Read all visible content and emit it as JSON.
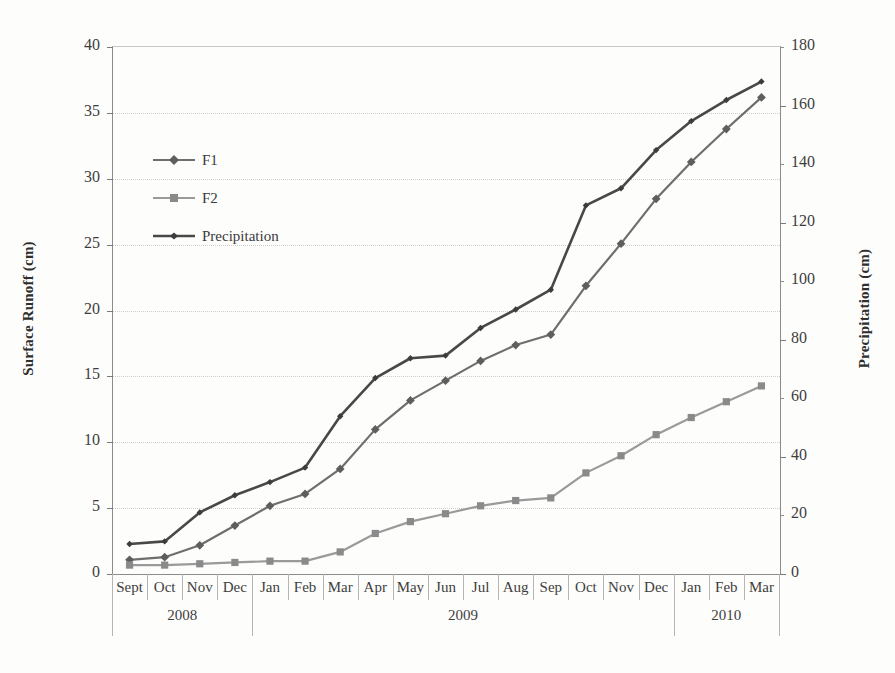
{
  "chart_data": {
    "type": "line",
    "title": "",
    "xlabel": "",
    "ylabel": "Surface Runoff (cm)",
    "y2label": "Precipitation (cm)",
    "ylim": [
      0,
      40
    ],
    "y2lim": [
      0,
      180
    ],
    "yticks": [
      0,
      5,
      10,
      15,
      20,
      25,
      30,
      35,
      40
    ],
    "y2ticks": [
      0,
      20,
      40,
      60,
      80,
      100,
      120,
      140,
      160,
      180
    ],
    "grid": true,
    "legend_position": "upper-left-inside",
    "categories": [
      "Sept",
      "Oct",
      "Nov",
      "Dec",
      "Jan",
      "Feb",
      "Mar",
      "Apr",
      "May",
      "Jun",
      "Jul",
      "Aug",
      "Sep",
      "Oct",
      "Nov",
      "Dec",
      "Jan",
      "Feb",
      "Mar"
    ],
    "year_groups": [
      {
        "label": "2008",
        "start": 0,
        "count": 4
      },
      {
        "label": "2009",
        "start": 4,
        "count": 12
      },
      {
        "label": "2010",
        "start": 16,
        "count": 3
      }
    ],
    "series": [
      {
        "name": "F1",
        "axis": "left",
        "color": "#6e6e6e",
        "marker": "diamond",
        "values": [
          1.0,
          1.2,
          2.1,
          3.6,
          5.1,
          6.0,
          7.9,
          10.9,
          13.1,
          14.6,
          16.1,
          17.3,
          18.1,
          21.8,
          25.0,
          28.4,
          31.2,
          33.7,
          36.1
        ]
      },
      {
        "name": "F2",
        "axis": "left",
        "color": "#9a9a9a",
        "marker": "square",
        "values": [
          0.6,
          0.6,
          0.7,
          0.8,
          0.9,
          0.9,
          1.6,
          3.0,
          3.9,
          4.5,
          5.1,
          5.5,
          5.7,
          7.6,
          8.9,
          10.5,
          11.8,
          13.0,
          14.2
        ]
      },
      {
        "name": "Precipitation",
        "axis": "right",
        "color": "#484848",
        "marker": "small-diamond",
        "values_left_scale": [
          2.2,
          2.4,
          4.6,
          5.9,
          6.9,
          8.0,
          11.9,
          14.8,
          16.3,
          16.5,
          18.6,
          20.0,
          21.5,
          27.9,
          29.2,
          32.1,
          34.3,
          35.9,
          37.3
        ],
        "values": [
          9.9,
          10.8,
          20.7,
          26.6,
          31.1,
          36.0,
          53.6,
          66.6,
          73.4,
          74.3,
          83.7,
          90.0,
          96.8,
          125.6,
          131.4,
          144.5,
          154.4,
          161.6,
          167.9
        ]
      }
    ]
  },
  "axes": {
    "left_title": "Surface Runoff (cm)",
    "right_title": "Precipitation (cm)"
  },
  "legend": {
    "items": [
      {
        "label": "F1"
      },
      {
        "label": "F2"
      },
      {
        "label": "Precipitation"
      }
    ]
  }
}
